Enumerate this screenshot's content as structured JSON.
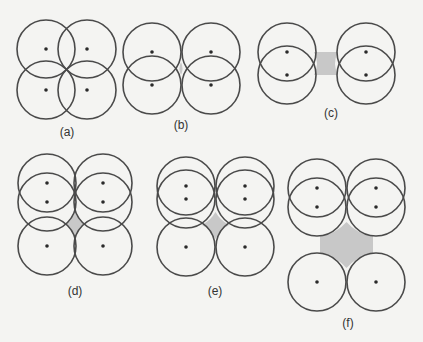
{
  "figure": {
    "panels": [
      {
        "id": "a",
        "label": "(a)",
        "description": "four circles, two by two, overlapping in a square grid",
        "circles": 4,
        "shaded_void": false
      },
      {
        "id": "b",
        "label": "(b)",
        "description": "two vertical pairs of overlapping circles, pairs touching side by side, small void between",
        "circles": 4,
        "shaded_void": true
      },
      {
        "id": "c",
        "label": "(c)",
        "description": "two vertical pairs of strongly overlapping circles, separated by a shaded gap",
        "circles": 4,
        "shaded_void": true
      },
      {
        "id": "d",
        "label": "(d)",
        "description": "two columns of three circles, top pairs overlapping, small shaded void",
        "circles": 6,
        "shaded_void": true
      },
      {
        "id": "e",
        "label": "(e)",
        "description": "two columns of three circles, top pairs strongly overlapping, larger shaded void",
        "circles": 6,
        "shaded_void": true
      },
      {
        "id": "f",
        "label": "(f)",
        "description": "two overlapping top pairs and two separate bottom circles with a large shaded void between",
        "circles": 6,
        "shaded_void": true
      }
    ],
    "colors": {
      "stroke": "#4a4a4a",
      "dot": "#2a2a2a",
      "shade": "#c8c8c8",
      "background": "#f4f4f2"
    }
  }
}
